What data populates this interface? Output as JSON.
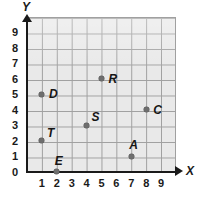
{
  "figure": {
    "kind": "coordinate-grid",
    "background_color": "#ffffff",
    "grid_fill_color": "#e9e9e9",
    "grid_line_color": "#a0a0a0",
    "axis_color": "#1a1a1a",
    "point_color": "#6e6e6e"
  },
  "axes": {
    "x_label": "X",
    "y_label": "Y",
    "x_ticks": [
      "1",
      "2",
      "3",
      "4",
      "5",
      "6",
      "7",
      "8",
      "9"
    ],
    "y_ticks": [
      "9",
      "8",
      "7",
      "6",
      "5",
      "4",
      "3",
      "2",
      "1",
      "0"
    ]
  },
  "chart_data": {
    "type": "scatter",
    "title": "",
    "xlabel": "X",
    "ylabel": "Y",
    "xlim": [
      0,
      10
    ],
    "ylim": [
      0,
      10
    ],
    "grid": true,
    "legend": "none",
    "x_tick_values": [
      1,
      2,
      3,
      4,
      5,
      6,
      7,
      8,
      9
    ],
    "y_tick_values": [
      0,
      1,
      2,
      3,
      4,
      5,
      6,
      7,
      8,
      9
    ],
    "points": [
      {
        "label": "D",
        "x": 1,
        "y": 5,
        "label_position": "right"
      },
      {
        "label": "T",
        "x": 1,
        "y": 2,
        "label_position": "upper-right"
      },
      {
        "label": "E",
        "x": 2,
        "y": 0,
        "label_position": "above"
      },
      {
        "label": "S",
        "x": 4,
        "y": 3,
        "label_position": "upper-right"
      },
      {
        "label": "R",
        "x": 5,
        "y": 6,
        "label_position": "right"
      },
      {
        "label": "A",
        "x": 7,
        "y": 1,
        "label_position": "above"
      },
      {
        "label": "C",
        "x": 8,
        "y": 4,
        "label_position": "right"
      }
    ]
  }
}
